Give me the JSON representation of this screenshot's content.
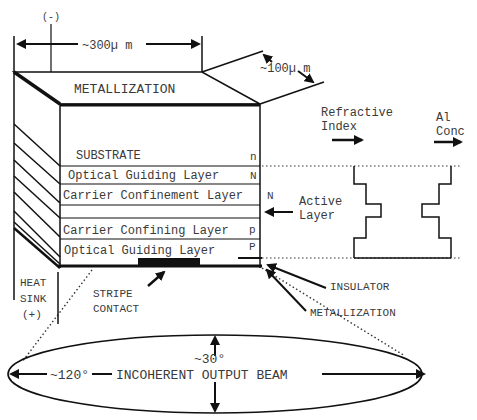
{
  "diagram": {
    "dimensions": {
      "width_label": "~300µ m",
      "depth_label": "~100µ m",
      "negative_terminal": "(-)"
    },
    "top_label": "METALLIZATION",
    "layers": [
      {
        "name": "SUBSTRATE",
        "type": "n"
      },
      {
        "name": "Optical Guiding Layer",
        "type": "N"
      },
      {
        "name": "Carrier Confinement Layer",
        "type": "N"
      },
      {
        "name": "",
        "type": ""
      },
      {
        "name": "Carrier Confining Layer",
        "type": "p"
      },
      {
        "name": "Optical Guiding Layer",
        "type": "P"
      }
    ],
    "profile_headers": {
      "refractive_index": [
        "Refractive",
        "Index"
      ],
      "al_conc": [
        "Al",
        "Conc"
      ]
    },
    "annotations": {
      "active_layer": [
        "Active",
        "Layer"
      ],
      "heat_sink": [
        "HEAT",
        "SINK",
        "(+)"
      ],
      "stripe_contact": [
        "STRIPE",
        "CONTACT"
      ],
      "insulator": "INSULATOR",
      "bottom_metallization": "METALLIZATION"
    },
    "beam": {
      "vertical_angle": "~30°",
      "horizontal_angle": "~120°",
      "label": "INCOHERENT OUTPUT BEAM"
    },
    "colors": {
      "line": "#111111",
      "text": "#3a3a3a",
      "background": "#ffffff"
    }
  }
}
